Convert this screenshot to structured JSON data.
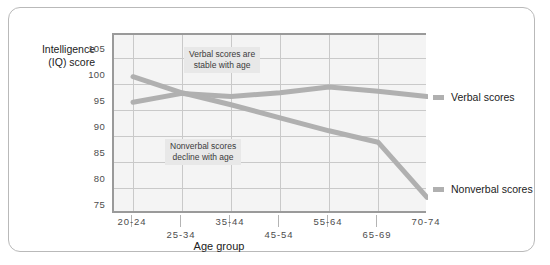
{
  "chart_data": {
    "type": "line",
    "title": "",
    "xlabel": "Age group",
    "ylabel": "Intelligence\n(IQ) score",
    "ylabel_line1": "Intelligence",
    "ylabel_line2": "(IQ) score",
    "categories": [
      "20-24",
      "25-34",
      "35-44",
      "45-54",
      "55-64",
      "65-69",
      "70-74"
    ],
    "yticks": [
      105,
      100,
      95,
      90,
      85,
      80,
      75
    ],
    "ylim": [
      75,
      107
    ],
    "grid": true,
    "legend_position": "right",
    "series": [
      {
        "name": "Verbal scores",
        "color": "#b0b0b0",
        "values": [
          96.5,
          98.2,
          97.6,
          98.3,
          99.4,
          98.6,
          97.6
        ]
      },
      {
        "name": "Nonverbal scores",
        "color": "#b0b0b0",
        "values": [
          101.4,
          98.3,
          96.0,
          93.5,
          91.0,
          88.8,
          78.2
        ]
      }
    ],
    "annotations": [
      {
        "text_line1": "Verbal scores are",
        "text_line2": "stable with age"
      },
      {
        "text_line1": "Nonverbal scores",
        "text_line2": "decline with age"
      }
    ]
  },
  "legend": {
    "items": [
      {
        "label": "Verbal scores",
        "color": "#b0b0b0"
      },
      {
        "label": "Nonverbal scores",
        "color": "#b0b0b0"
      }
    ]
  },
  "axis": {
    "y_tick_labels": [
      "105",
      "100",
      "95",
      "90",
      "85",
      "80",
      "75"
    ],
    "x_tick_labels": [
      "20-24",
      "25-34",
      "35-44",
      "45-54",
      "55-64",
      "65-69",
      "70-74"
    ],
    "x_title": "Age group",
    "y_title_line1": "Intelligence",
    "y_title_line2": "(IQ) score"
  },
  "annotations": {
    "verbal_line1": "Verbal scores are",
    "verbal_line2": "stable with age",
    "nonverbal_line1": "Nonverbal scores",
    "nonverbal_line2": "decline with age"
  }
}
